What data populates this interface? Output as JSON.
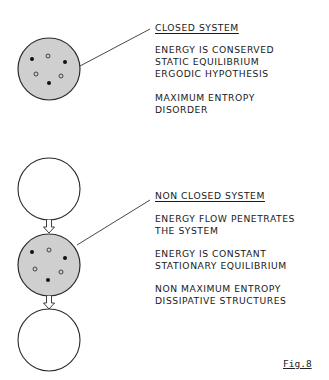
{
  "closed_system": {
    "title": "CLOSED SYSTEM",
    "lines_group1": [
      "ENERGY IS CONSERVED",
      "STATIC EQUILIBRIUM",
      "ERGODIC HYPOTHESIS"
    ],
    "lines_group2": [
      "MAXIMUM ENTROPY",
      "DISORDER"
    ]
  },
  "non_closed_system": {
    "title": "NON CLOSED SYSTEM",
    "lines_group1": [
      "ENERGY FLOW PENETRATES",
      "THE SYSTEM"
    ],
    "lines_group2": [
      "ENERGY IS CONSTANT",
      "STATIONARY EQUILIBRIUM"
    ],
    "lines_group3": [
      "NON MAXIMUM ENTROPY",
      "DISSIPATIVE STRUCTURES"
    ]
  },
  "figure_label": "Fig.8",
  "colors": {
    "system_fill": "#cfcfcf",
    "outline": "#2a2a2a",
    "background": "#ffffff"
  }
}
